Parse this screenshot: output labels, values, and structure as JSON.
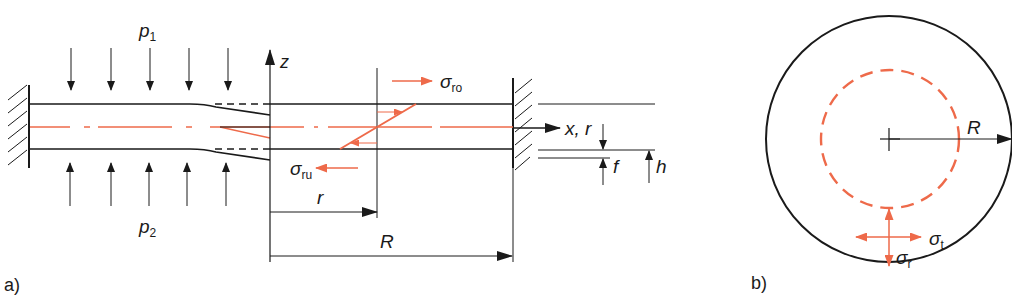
{
  "colors": {
    "ink": "#1a1a1a",
    "accent": "#ee6a4a"
  },
  "panel_a": {
    "label": "a)",
    "load_top": {
      "symbol": "p",
      "subscript": "1"
    },
    "load_bottom": {
      "symbol": "p",
      "subscript": "2"
    },
    "axis_z": "z",
    "axis_x": "x, r",
    "radius_small": "r",
    "radius_large": "R",
    "stress_top": {
      "symbol": "σ",
      "subscript": "ro"
    },
    "stress_bottom": {
      "symbol": "σ",
      "subscript": "ru"
    },
    "deflection": "f",
    "thickness": "h"
  },
  "panel_b": {
    "label": "b)",
    "radius": "R",
    "stress_tangential": {
      "symbol": "σ",
      "subscript": "t"
    },
    "stress_radial": {
      "symbol": "σ",
      "subscript": "r"
    }
  }
}
